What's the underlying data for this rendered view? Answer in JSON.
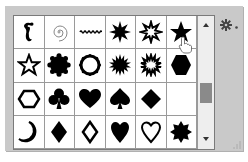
{
  "panel": {
    "title": "Custom Shape Picker",
    "columns": 6,
    "rows": 4,
    "selected_index": 5
  },
  "shapes": [
    {
      "name": "ornament-fleuron",
      "fill": "filled"
    },
    {
      "name": "spiral",
      "fill": "outline"
    },
    {
      "name": "wavy-line",
      "fill": "filled"
    },
    {
      "name": "starburst-12",
      "fill": "filled"
    },
    {
      "name": "starburst-12-outline",
      "fill": "outline"
    },
    {
      "name": "star-5",
      "fill": "filled"
    },
    {
      "name": "star-5-outline",
      "fill": "outline"
    },
    {
      "name": "scalloped-circle",
      "fill": "filled"
    },
    {
      "name": "scalloped-circle-outline",
      "fill": "outline"
    },
    {
      "name": "starburst-16",
      "fill": "filled"
    },
    {
      "name": "starburst-16-outline",
      "fill": "outline"
    },
    {
      "name": "hexagon",
      "fill": "filled"
    },
    {
      "name": "hexagon-outline",
      "fill": "outline"
    },
    {
      "name": "club",
      "fill": "filled"
    },
    {
      "name": "heart-card",
      "fill": "filled"
    },
    {
      "name": "spade",
      "fill": "filled"
    },
    {
      "name": "diamond-card",
      "fill": "filled"
    },
    {
      "name": "crescent-moon",
      "fill": "filled"
    },
    {
      "name": "crescent-moon-outline",
      "fill": "outline"
    },
    {
      "name": "diamond",
      "fill": "filled"
    },
    {
      "name": "diamond-outline",
      "fill": "outline"
    },
    {
      "name": "heart",
      "fill": "filled"
    },
    {
      "name": "heart-outline",
      "fill": "outline"
    },
    {
      "name": "seal-8-point",
      "fill": "filled"
    }
  ],
  "scrollbar": {
    "up_icon": "arrow-up-icon",
    "down_icon": "arrow-down-icon",
    "thumb_position": "middle"
  },
  "menu": {
    "icon": "gear-icon"
  },
  "colors": {
    "panel_bg": "#c9c9c9",
    "grid_bg": "#ffffff",
    "grid_line": "#9a9a9a",
    "shape": "#000000",
    "scroll_thumb": "#8a8a8a"
  }
}
